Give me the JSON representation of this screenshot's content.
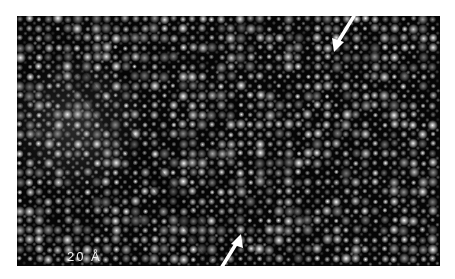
{
  "figure": {
    "scale_bar": {
      "label": "20 Å",
      "length_px": 78
    },
    "arrows": [
      {
        "name": "top-right-arrow",
        "tip": [
          336,
          46
        ],
        "direction": "down-left"
      },
      {
        "name": "bottom-arrow",
        "tip": [
          240,
          236
        ],
        "direction": "up-right"
      }
    ],
    "lattice": {
      "spacing_px": 9.6,
      "background": "#050505",
      "spot_color": "#ffffff"
    }
  }
}
